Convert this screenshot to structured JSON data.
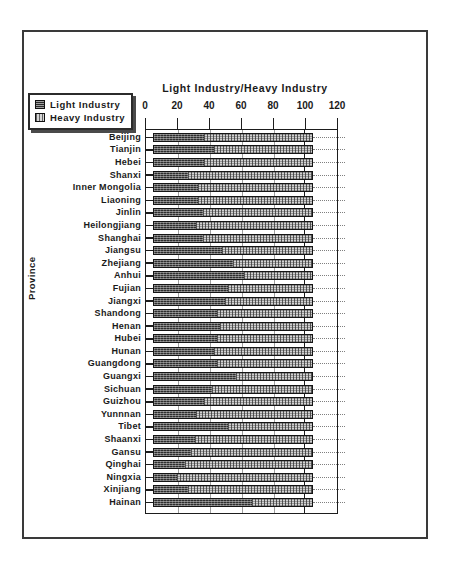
{
  "figure": {
    "title": "Light Industry/Heavy Industry",
    "yaxis_title": "Province"
  },
  "legend": {
    "items": [
      {
        "label": "Light Industry",
        "swatch": "dark-hatch-swatch"
      },
      {
        "label": "Heavy Industry",
        "swatch": "light-dotted-swatch"
      }
    ]
  },
  "chart_data": {
    "type": "bar",
    "subtype": "stacked-horizontal-100-percent",
    "title": "Light Industry/Heavy Industry",
    "xlabel": "",
    "ylabel": "Province",
    "xlim": [
      0,
      120
    ],
    "xticks": [
      0,
      20,
      40,
      60,
      80,
      100,
      120
    ],
    "grid": true,
    "legend_position": "top-left-outside",
    "orientation": "horizontal",
    "categories": [
      "Beijing",
      "Tianjin",
      "Hebei",
      "Shanxi",
      "Inner Mongolia",
      "Liaoning",
      "Jinlin",
      "Heilongjiang",
      "Shanghai",
      "Jiangsu",
      "Zhejiang",
      "Anhui",
      "Fujian",
      "Jiangxi",
      "Shandong",
      "Henan",
      "Hubei",
      "Hunan",
      "Guangdong",
      "Guangxi",
      "Sichuan",
      "Guizhou",
      "Yunnnan",
      "Tibet",
      "Shaanxi",
      "Gansu",
      "Qinghai",
      "Ningxia",
      "Xinjiang",
      "Hainan"
    ],
    "series": [
      {
        "name": "Light Industry",
        "values": [
          32,
          38,
          32,
          22,
          28,
          28,
          31,
          27,
          31,
          43,
          50,
          57,
          47,
          45,
          40,
          42,
          40,
          38,
          40,
          52,
          37,
          32,
          27,
          47,
          26,
          24,
          20,
          15,
          22,
          62
        ]
      },
      {
        "name": "Heavy Industry",
        "values": [
          68,
          62,
          68,
          78,
          72,
          72,
          69,
          73,
          69,
          57,
          50,
          43,
          53,
          55,
          60,
          58,
          60,
          62,
          60,
          48,
          63,
          68,
          73,
          53,
          74,
          76,
          80,
          85,
          78,
          38
        ]
      }
    ]
  }
}
